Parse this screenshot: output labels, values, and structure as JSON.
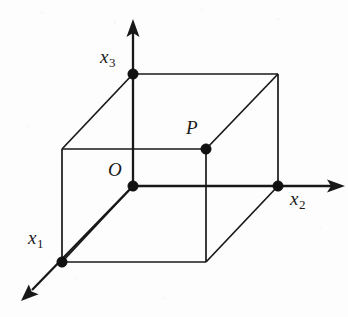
{
  "figure": {
    "kind": "3d-coordinate-cube-diagram",
    "width": 348,
    "height": 317,
    "background_color": "#fdfdfd",
    "ink_color": "#181818"
  },
  "labels": {
    "x1": {
      "base": "x",
      "sub": "1",
      "x": 28,
      "y": 228
    },
    "x2": {
      "base": "x",
      "sub": "2",
      "x": 290,
      "y": 189
    },
    "x3": {
      "base": "x",
      "sub": "3",
      "x": 100,
      "y": 47
    },
    "origin": {
      "base": "O",
      "sub": "",
      "x": 108,
      "y": 160
    },
    "point_p": {
      "base": "P",
      "sub": "",
      "x": 186,
      "y": 118
    }
  },
  "axes": [
    {
      "name": "x3-axis",
      "label": "x3",
      "from": [
        133,
        186
      ],
      "to": [
        133,
        21
      ],
      "direction": "up"
    },
    {
      "name": "x2-axis",
      "label": "x2",
      "from": [
        133,
        186
      ],
      "to": [
        344,
        186
      ],
      "direction": "right"
    },
    {
      "name": "x1-axis",
      "label": "x1",
      "from": [
        133,
        186
      ],
      "to": [
        22,
        300
      ],
      "direction": "down-left"
    }
  ],
  "cube": {
    "front_face": [
      [
        62,
        149
      ],
      [
        206,
        149
      ],
      [
        206,
        262
      ],
      [
        62,
        262
      ]
    ],
    "back_face": [
      [
        133,
        74
      ],
      [
        278,
        74
      ],
      [
        278,
        186
      ],
      [
        133,
        186
      ]
    ],
    "depth_offset": [
      71,
      -75
    ]
  },
  "marked_points": [
    {
      "name": "origin",
      "label": "O",
      "x": 133,
      "y": 186
    },
    {
      "name": "point-p",
      "label": "P",
      "x": 206,
      "y": 149
    },
    {
      "name": "x3-intercept",
      "label": "",
      "x": 133,
      "y": 74
    },
    {
      "name": "x2-intercept",
      "label": "",
      "x": 278,
      "y": 186
    },
    {
      "name": "x1-intercept",
      "label": "",
      "x": 62,
      "y": 262
    }
  ]
}
